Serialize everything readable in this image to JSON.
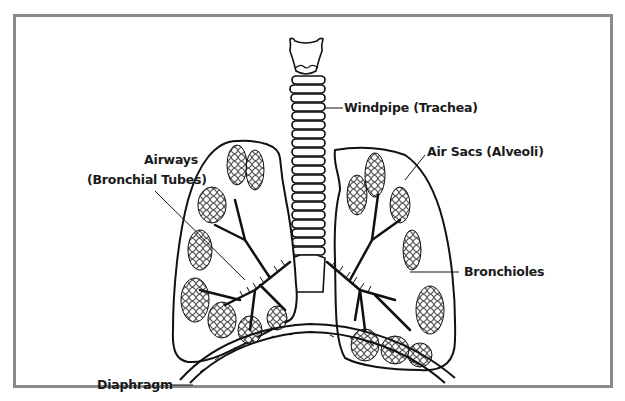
{
  "diagram": {
    "labels": {
      "trachea": "Windpipe (Trachea)",
      "airways_line1": "Airways",
      "airways_line2": "(Bronchial Tubes)",
      "alveoli": "Air Sacs (Alveoli)",
      "bronchioles": "Bronchioles",
      "diaphragm": "Diaphragm"
    },
    "colors": {
      "frame": "#8a8a8a",
      "ink": "#111111",
      "background": "#ffffff"
    }
  }
}
